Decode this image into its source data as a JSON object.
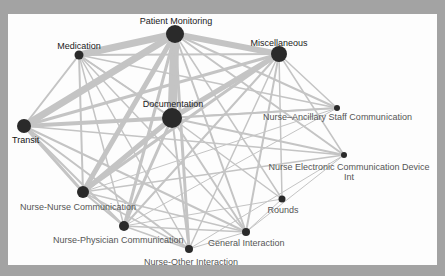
{
  "graph": {
    "type": "network",
    "background_frame": "#a3a3a3",
    "panel_color": "#fdfdfd",
    "edge_color": "#c4c4c4",
    "node_color": "#2a2a2a",
    "nodes": [
      {
        "id": "pm",
        "label": "Patient Monitoring",
        "x": 175,
        "y": 34,
        "r": 9
      },
      {
        "id": "med",
        "label": "Medication",
        "x": 79,
        "y": 55,
        "r": 4.5
      },
      {
        "id": "mis",
        "label": "Miscellaneous",
        "x": 279,
        "y": 54,
        "r": 8
      },
      {
        "id": "doc",
        "label": "Documentation",
        "x": 172,
        "y": 118,
        "r": 10
      },
      {
        "id": "tr",
        "label": "Transit",
        "x": 24,
        "y": 126,
        "r": 7
      },
      {
        "id": "nas",
        "label": "Nurse–Ancillary Staff Communication",
        "x": 337,
        "y": 108,
        "r": 3
      },
      {
        "id": "ned",
        "label": "Nurse Electronic Communication Device Int",
        "label_line1": "Nurse Electronic Communication Device",
        "label_line2": "Int",
        "x": 344,
        "y": 155,
        "r": 3
      },
      {
        "id": "ro",
        "label": "Rounds",
        "x": 282,
        "y": 199,
        "r": 3.5
      },
      {
        "id": "nn",
        "label": "Nurse-Nurse Communication",
        "x": 83,
        "y": 192,
        "r": 6
      },
      {
        "id": "np",
        "label": "Nurse-Physician Communication",
        "x": 124,
        "y": 226,
        "r": 5
      },
      {
        "id": "gi",
        "label": "General Interaction",
        "x": 246,
        "y": 232,
        "r": 4
      },
      {
        "id": "no",
        "label": "Nurse-Other Interaction",
        "x": 189,
        "y": 249,
        "r": 4
      }
    ],
    "edges": [
      [
        "pm",
        "doc",
        9
      ],
      [
        "pm",
        "tr",
        7
      ],
      [
        "pm",
        "mis",
        6
      ],
      [
        "pm",
        "med",
        7
      ],
      [
        "pm",
        "nn",
        5
      ],
      [
        "pm",
        "np",
        3
      ],
      [
        "pm",
        "no",
        3
      ],
      [
        "pm",
        "gi",
        2
      ],
      [
        "pm",
        "nas",
        2
      ],
      [
        "pm",
        "ned",
        2
      ],
      [
        "pm",
        "ro",
        1.5
      ],
      [
        "doc",
        "tr",
        4
      ],
      [
        "doc",
        "mis",
        5
      ],
      [
        "doc",
        "nn",
        5
      ],
      [
        "doc",
        "np",
        3
      ],
      [
        "doc",
        "med",
        2
      ],
      [
        "doc",
        "nas",
        2
      ],
      [
        "doc",
        "ned",
        2
      ],
      [
        "doc",
        "gi",
        2
      ],
      [
        "doc",
        "no",
        2
      ],
      [
        "doc",
        "ro",
        1.5
      ],
      [
        "tr",
        "med",
        2
      ],
      [
        "tr",
        "mis",
        3
      ],
      [
        "tr",
        "nn",
        3
      ],
      [
        "tr",
        "np",
        2
      ],
      [
        "tr",
        "gi",
        2
      ],
      [
        "tr",
        "no",
        2
      ],
      [
        "tr",
        "ned",
        1.5
      ],
      [
        "tr",
        "nas",
        1.5
      ],
      [
        "med",
        "mis",
        2
      ],
      [
        "med",
        "nn",
        2
      ],
      [
        "med",
        "np",
        1.5
      ],
      [
        "med",
        "no",
        1.5
      ],
      [
        "med",
        "gi",
        1.5
      ],
      [
        "med",
        "nas",
        1.5
      ],
      [
        "med",
        "doc",
        1.5
      ],
      [
        "mis",
        "nn",
        3
      ],
      [
        "mis",
        "np",
        2
      ],
      [
        "mis",
        "gi",
        2
      ],
      [
        "mis",
        "no",
        1.5
      ],
      [
        "mis",
        "nas",
        1.5
      ],
      [
        "mis",
        "ned",
        1.5
      ],
      [
        "mis",
        "ro",
        1.5
      ],
      [
        "nn",
        "np",
        2
      ],
      [
        "nn",
        "gi",
        1.5
      ],
      [
        "nn",
        "no",
        1.5
      ],
      [
        "nn",
        "ned",
        1.5
      ],
      [
        "nn",
        "nas",
        1
      ],
      [
        "np",
        "gi",
        1.5
      ],
      [
        "np",
        "no",
        1.5
      ],
      [
        "np",
        "ro",
        1
      ],
      [
        "np",
        "nas",
        1
      ],
      [
        "gi",
        "no",
        1
      ],
      [
        "gi",
        "ro",
        1
      ],
      [
        "gi",
        "ned",
        1
      ],
      [
        "no",
        "ned",
        1
      ]
    ]
  }
}
